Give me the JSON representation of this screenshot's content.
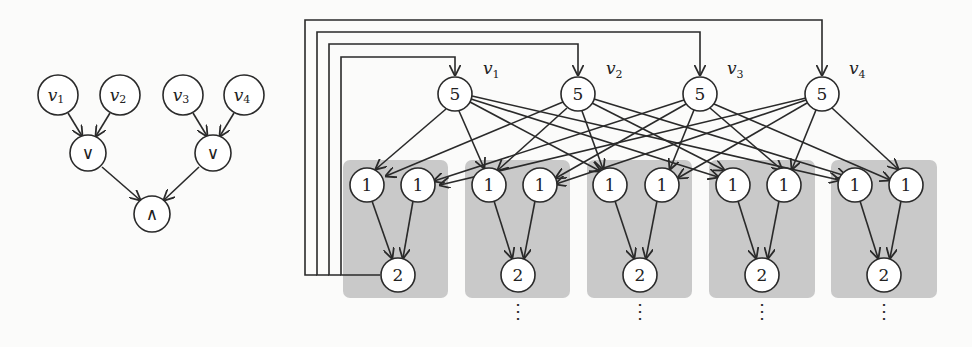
{
  "left_diagram": {
    "title": "Boolean formula tree",
    "inputs": [
      {
        "label": "v",
        "sub": "1"
      },
      {
        "label": "v",
        "sub": "2"
      },
      {
        "label": "v",
        "sub": "3"
      },
      {
        "label": "v",
        "sub": "4"
      }
    ],
    "or_gates": [
      "∨",
      "∨"
    ],
    "and_gate": "∧"
  },
  "right_diagram": {
    "top_nodes": [
      {
        "value": "5",
        "label": "v",
        "sub": "1"
      },
      {
        "value": "5",
        "label": "v",
        "sub": "2"
      },
      {
        "value": "5",
        "label": "v",
        "sub": "3"
      },
      {
        "value": "5",
        "label": "v",
        "sub": "4"
      }
    ],
    "gadgets": [
      {
        "inputs": [
          "1",
          "1"
        ],
        "output": "2",
        "continues": false,
        "feedback": true
      },
      {
        "inputs": [
          "1",
          "1"
        ],
        "output": "2",
        "continues": true
      },
      {
        "inputs": [
          "1",
          "1"
        ],
        "output": "2",
        "continues": true
      },
      {
        "inputs": [
          "1",
          "1"
        ],
        "output": "2",
        "continues": true
      },
      {
        "inputs": [
          "1",
          "1"
        ],
        "output": "2",
        "continues": true
      }
    ],
    "ellipsis": "⋮"
  },
  "colors": {
    "background": "#fbfbfa",
    "gadget_box": "#c9c9c9",
    "stroke": "#2a2a2a",
    "node_fill": "#ffffff"
  }
}
